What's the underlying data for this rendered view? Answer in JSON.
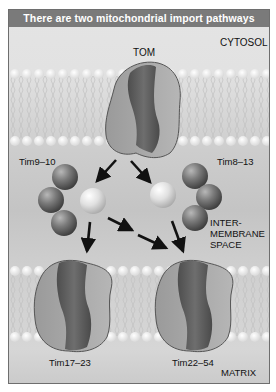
{
  "title": "There are two mitochondrial import pathways",
  "labels": {
    "cytosol": "CYTOSOL",
    "tom": "TOM",
    "tim9_10": "Tim9–10",
    "tim8_13": "Tim8–13",
    "intermembrane_1": "INTER-",
    "intermembrane_2": "MEMBRANE",
    "intermembrane_3": "SPACE",
    "tim17_23": "Tim17–23",
    "tim22_54": "Tim22–54",
    "matrix": "MATRIX"
  },
  "colors": {
    "title_bar": "#7a7a7a",
    "background": "#dcdcdc",
    "membrane_head": "#f2f2f2",
    "protein_light": "#a8a8a8",
    "protein_dark": "#5c5c5c",
    "arrow": "#111111"
  }
}
